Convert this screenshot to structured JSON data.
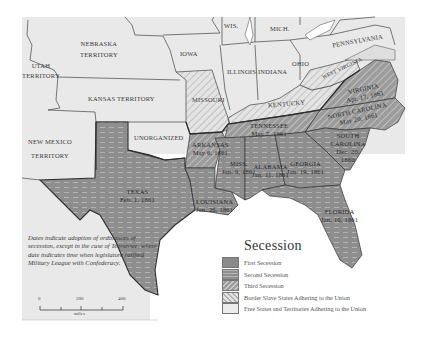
{
  "map": {
    "title": "Secession",
    "colors": {
      "background": "#ffffff",
      "land_union": "#e9e9e9",
      "first_secession": "#8a8a8a",
      "second_secession": "#9a9a9a",
      "third_secession": "#a5a5a5",
      "border_states": "#d4d4d4",
      "border_line": "#2e2e2e"
    },
    "territories": [
      {
        "name": "NEBRASKA",
        "line2": "TERRITORY"
      },
      {
        "name": "UTAH",
        "line2": "TERRITORY"
      },
      {
        "name": "KANSAS TERRITORY"
      },
      {
        "name": "NEW MEXICO",
        "line2": "TERRITORY"
      },
      {
        "name": "UNORGANIZED"
      }
    ],
    "free_states": [
      "WIS.",
      "MICH.",
      "IOWA",
      "ILLINOIS",
      "INDIANA",
      "OHIO",
      "PENNSYLVANIA"
    ],
    "border_states": [
      "MISSOURI",
      "KENTUCKY",
      "WEST VIRGINIA"
    ],
    "seceded_states": [
      {
        "name": "TEXAS",
        "date": "Feb. 1, 1861",
        "group": "First Secession"
      },
      {
        "name": "LOUISIANA",
        "date": "Jan. 26, 1861",
        "group": "First Secession"
      },
      {
        "name": "MISS.",
        "date": "Jan. 9, 1861",
        "group": "First Secession"
      },
      {
        "name": "ALABAMA",
        "date": "Jan. 11, 1861",
        "group": "First Secession"
      },
      {
        "name": "GEORGIA",
        "date": "Jan. 19, 1861",
        "group": "First Secession"
      },
      {
        "name": "FLORIDA",
        "date": "Jan. 10, 1861",
        "group": "First Secession"
      },
      {
        "name": "SOUTH CAROLINA",
        "date": "Dec. 20, 1860",
        "group": "First Secession"
      },
      {
        "name": "ARKANSAS",
        "date": "May 6, 1861",
        "group": "Third Secession"
      },
      {
        "name": "TENNESSEE",
        "date": "May 7, 1861",
        "group": "Third Secession"
      },
      {
        "name": "VIRGINIA",
        "date": "Apr. 17, 1861",
        "group": "Third Secession"
      },
      {
        "name": "NORTH CAROLINA",
        "date": "May 20, 1861",
        "group": "Third Secession"
      }
    ],
    "note": "Dates indicate adoption of ordinances of secession, except in the case of Tennessee, where date indicates time when legislature ratified Military League with Confederacy.",
    "scale": {
      "ticks": [
        "0",
        "200",
        "400"
      ],
      "unit": "miles"
    },
    "legend": [
      {
        "label": "First Secession",
        "pattern": "solid-dark"
      },
      {
        "label": "Second Secession",
        "pattern": "dashed"
      },
      {
        "label": "Third Secession",
        "pattern": "hatch-dark"
      },
      {
        "label": "Border Slave States Adhering to the Union",
        "pattern": "hatch-light"
      },
      {
        "label": "Free States and Territories Adhering to the Union",
        "pattern": "light"
      }
    ]
  }
}
